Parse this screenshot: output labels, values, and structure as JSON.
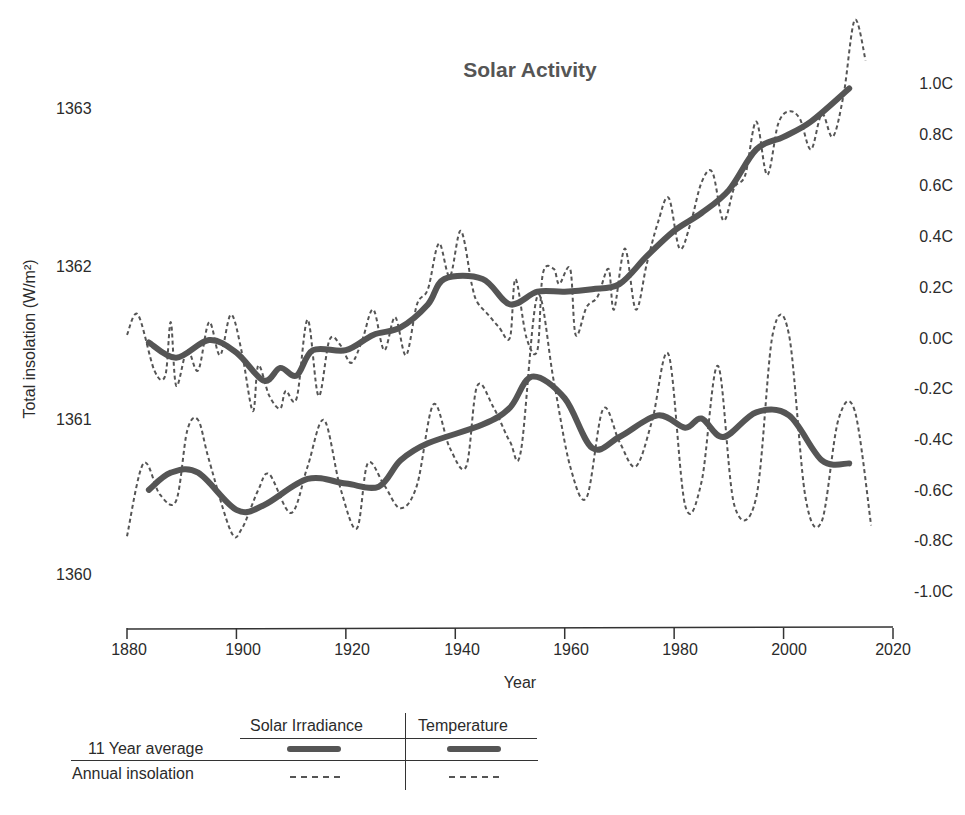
{
  "chart_data": {
    "type": "line",
    "title": "Solar Activity",
    "xlabel": "Year",
    "ylabel_left": "Total insolation (W/m²)",
    "ylabel_right": "",
    "xlim": [
      1880,
      2020
    ],
    "ylim_left": [
      1360,
      1363
    ],
    "ylim_right": [
      -1.0,
      1.0
    ],
    "x_ticks": [
      "1880",
      "1900",
      "1920",
      "1940",
      "1960",
      "1980",
      "2000",
      "2020"
    ],
    "y_ticks_left": [
      "1363",
      "1362",
      "1361",
      "1360"
    ],
    "y_ticks_right": [
      "1.0C",
      "0.8C",
      "0.6C",
      "0.4C",
      "0.2C",
      "0.0C",
      "-0.2C",
      "-0.4C",
      "-0.6C",
      "-0.8C",
      "-1.0C"
    ],
    "grid": false,
    "legend_position": "bottom-left table",
    "series": [
      {
        "name": "Temperature (11 Year average)",
        "axis": "right",
        "style": "solid-thick",
        "x": [
          1884,
          1889,
          1895,
          1900,
          1905,
          1908,
          1911,
          1914,
          1920,
          1925,
          1930,
          1935,
          1938,
          1945,
          1950,
          1955,
          1960,
          1965,
          1970,
          1975,
          1980,
          1985,
          1990,
          1995,
          2000,
          2005,
          2012
        ],
        "values": [
          -0.01,
          -0.07,
          0.0,
          -0.05,
          -0.16,
          -0.11,
          -0.14,
          -0.04,
          -0.04,
          0.02,
          0.05,
          0.14,
          0.24,
          0.24,
          0.14,
          0.19,
          0.19,
          0.2,
          0.22,
          0.33,
          0.43,
          0.5,
          0.59,
          0.75,
          0.8,
          0.86,
          0.99
        ]
      },
      {
        "name": "Temperature (Annual)",
        "axis": "right",
        "style": "dashed",
        "x": [
          1880,
          1882,
          1885,
          1887,
          1888,
          1889,
          1891,
          1893,
          1895,
          1897,
          1899,
          1901,
          1903,
          1904,
          1906,
          1908,
          1909,
          1911,
          1913,
          1915,
          1917,
          1919,
          1921,
          1923,
          1925,
          1927,
          1929,
          1931,
          1933,
          1935,
          1937,
          1939,
          1941,
          1943,
          1944,
          1946,
          1948,
          1950,
          1951,
          1953,
          1955,
          1956,
          1958,
          1959,
          1961,
          1962,
          1964,
          1966,
          1968,
          1969,
          1971,
          1973,
          1975,
          1977,
          1979,
          1981,
          1983,
          1985,
          1987,
          1989,
          1991,
          1993,
          1995,
          1997,
          1999,
          2001,
          2003,
          2005,
          2007,
          2009,
          2011,
          2013,
          2015
        ],
        "values": [
          0.02,
          0.1,
          -0.12,
          -0.14,
          0.07,
          -0.18,
          -0.04,
          -0.12,
          0.07,
          -0.06,
          0.1,
          -0.05,
          -0.28,
          -0.1,
          -0.22,
          -0.27,
          -0.2,
          -0.23,
          0.08,
          -0.22,
          0.0,
          -0.02,
          -0.09,
          0.0,
          0.12,
          -0.04,
          0.09,
          -0.06,
          0.14,
          0.2,
          0.38,
          0.25,
          0.43,
          0.22,
          0.15,
          0.1,
          0.05,
          0.01,
          0.24,
          0.01,
          -0.04,
          0.26,
          0.28,
          0.22,
          0.28,
          0.02,
          0.13,
          0.17,
          0.28,
          0.12,
          0.36,
          0.12,
          0.3,
          0.46,
          0.56,
          0.36,
          0.46,
          0.62,
          0.66,
          0.47,
          0.6,
          0.65,
          0.86,
          0.65,
          0.85,
          0.9,
          0.87,
          0.75,
          0.89,
          0.8,
          0.97,
          1.26,
          1.1
        ]
      },
      {
        "name": "Solar Irradiance (11 Year average)",
        "axis": "left",
        "style": "solid-thick",
        "x": [
          1884,
          1888,
          1893,
          1900,
          1905,
          1913,
          1920,
          1926,
          1930,
          1935,
          1945,
          1950,
          1954,
          1960,
          1965,
          1970,
          1977,
          1982,
          1985,
          1989,
          1995,
          2001,
          2007,
          2012
        ],
        "values": [
          1360.55,
          1360.66,
          1360.66,
          1360.42,
          1360.45,
          1360.62,
          1360.59,
          1360.57,
          1360.74,
          1360.85,
          1360.97,
          1361.08,
          1361.28,
          1361.14,
          1360.82,
          1360.89,
          1361.03,
          1360.95,
          1361.01,
          1360.89,
          1361.05,
          1361.03,
          1360.74,
          1360.72
        ]
      },
      {
        "name": "Solar Irradiance (Annual)",
        "axis": "left",
        "style": "dashed",
        "x": [
          1880,
          1883,
          1886,
          1889,
          1891,
          1893,
          1895,
          1899,
          1901,
          1904,
          1906,
          1910,
          1913,
          1916,
          1919,
          1922,
          1924,
          1927,
          1930,
          1933,
          1936,
          1939,
          1942,
          1944,
          1947,
          1950,
          1952,
          1955,
          1958,
          1961,
          1964,
          1967,
          1970,
          1973,
          1976,
          1979,
          1982,
          1985,
          1988,
          1991,
          1995,
          1998,
          2001,
          2004,
          2007,
          2010,
          2013,
          2016
        ],
        "values": [
          1360.25,
          1360.72,
          1360.52,
          1360.48,
          1360.93,
          1361.0,
          1360.74,
          1360.28,
          1360.3,
          1360.55,
          1360.65,
          1360.4,
          1360.7,
          1361.0,
          1360.56,
          1360.3,
          1360.72,
          1360.58,
          1360.43,
          1360.58,
          1361.1,
          1360.82,
          1360.7,
          1361.22,
          1361.08,
          1360.86,
          1360.8,
          1361.8,
          1361.25,
          1360.7,
          1360.5,
          1361.07,
          1360.86,
          1360.7,
          1361.0,
          1361.42,
          1360.45,
          1360.6,
          1361.35,
          1360.45,
          1360.5,
          1361.55,
          1361.55,
          1360.5,
          1360.35,
          1361.0,
          1361.06,
          1360.32
        ]
      }
    ]
  },
  "legend": {
    "col_headers": [
      "Solar Irradiance",
      "Temperature"
    ],
    "rows": [
      {
        "label": "11 Year average",
        "style": "solid-thick"
      },
      {
        "label": "Annual insolation",
        "style": "dashed"
      }
    ]
  },
  "colors": {
    "line": "#555555",
    "axis": "#333333",
    "text": "#2b2b2b",
    "title": "#555555"
  }
}
